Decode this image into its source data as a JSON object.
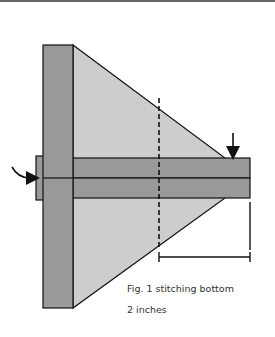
{
  "figure": {
    "caption": "Fig. 1 stitching bottom",
    "measurement": "2 inches",
    "colors": {
      "dark_fabric": "#999999",
      "light_fabric": "#cccccc",
      "outline": "#111111"
    }
  }
}
